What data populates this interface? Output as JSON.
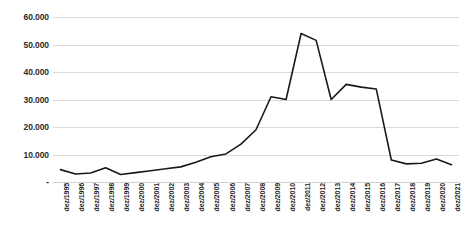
{
  "chart_data": {
    "type": "line",
    "title": "",
    "xlabel": "",
    "ylabel": "",
    "ylim": [
      0,
      60000
    ],
    "yticks": [
      0,
      10000,
      20000,
      30000,
      40000,
      50000,
      60000
    ],
    "ytick_labels": [
      "-",
      "10.000",
      "20.000",
      "30.000",
      "40.000",
      "50.000",
      "60.000"
    ],
    "grid": true,
    "legend": "none",
    "line_color": "#1a1a1a",
    "grid_color": "#d9d9d9",
    "categories": [
      "dez/1995",
      "dez/1996",
      "dez/1997",
      "dez/1998",
      "dez/1999",
      "dez/2000",
      "dez/2001",
      "dez/2002",
      "dez/2003",
      "dez/2004",
      "dez/2005",
      "dez/2006",
      "dez/2007",
      "dez/2008",
      "dez/2009",
      "dez/2010",
      "dez/2011",
      "dez/2012",
      "dez/2013",
      "dez/2014",
      "dez/2015",
      "dez/2016",
      "dez/2017",
      "dez/2018",
      "dez/2019",
      "dez/2020",
      "dez/2021"
    ],
    "values": [
      4500,
      2900,
      3300,
      5200,
      2700,
      3400,
      4100,
      4800,
      5500,
      7200,
      9200,
      10200,
      13800,
      19000,
      31000,
      30000,
      54000,
      51500,
      30000,
      35500,
      34500,
      33800,
      8000,
      6600,
      6800,
      8400,
      6300
    ]
  }
}
